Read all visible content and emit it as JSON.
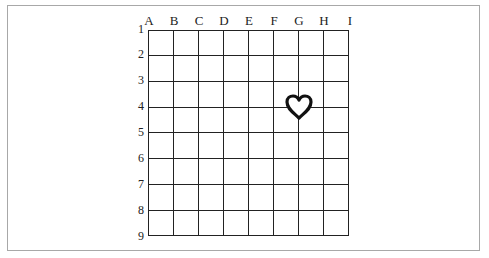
{
  "diagram": {
    "type": "grid",
    "columns": [
      "A",
      "B",
      "C",
      "D",
      "E",
      "F",
      "G",
      "H",
      "I"
    ],
    "rows": [
      "1",
      "2",
      "3",
      "4",
      "5",
      "6",
      "7",
      "8",
      "9"
    ],
    "marker": {
      "icon": "heart-outline-icon",
      "column": "G",
      "row": "4",
      "color": "#111111"
    }
  }
}
